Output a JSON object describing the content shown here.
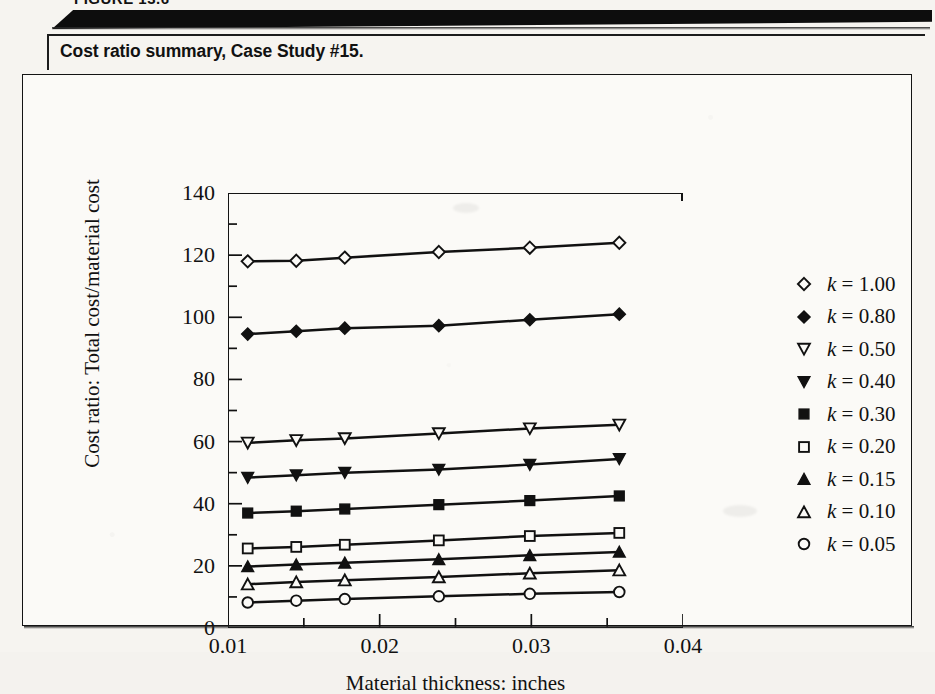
{
  "figure": {
    "number_label": "FIGURE 13.6",
    "caption": "Cost ratio summary, Case Study #15."
  },
  "chart_data": {
    "type": "line",
    "title": "",
    "xlabel": "Material thickness:  inches",
    "ylabel": "Cost ratio:  Total cost/material cost",
    "xlim": [
      0.01,
      0.04
    ],
    "ylim": [
      0,
      140
    ],
    "xticks": [
      0.01,
      0.015,
      0.02,
      0.025,
      0.03,
      0.035,
      0.04
    ],
    "xtick_labels": [
      "0.01",
      "",
      "0.02",
      "",
      "0.03",
      "",
      "0.04"
    ],
    "yticks": [
      0,
      10,
      20,
      30,
      40,
      50,
      60,
      70,
      80,
      90,
      100,
      110,
      120,
      130,
      140
    ],
    "ytick_labels": [
      "0",
      "",
      "20",
      "",
      "40",
      "",
      "60",
      "",
      "80",
      "",
      "100",
      "",
      "120",
      "",
      "140"
    ],
    "grid": false,
    "legend_position": "right",
    "x": [
      0.0113,
      0.0145,
      0.0177,
      0.0239,
      0.0299,
      0.0358
    ],
    "series": [
      {
        "name": "k = 1.00",
        "marker": "diamond-open",
        "values": [
          118.0,
          118.2,
          119.2,
          121.0,
          122.4,
          124.0
        ]
      },
      {
        "name": "k = 0.80",
        "marker": "diamond-filled",
        "values": [
          94.6,
          95.5,
          96.5,
          97.3,
          99.2,
          101.0
        ]
      },
      {
        "name": "k = 0.50",
        "marker": "triangle-down-open",
        "values": [
          59.6,
          60.4,
          61.0,
          62.6,
          64.2,
          65.4
        ]
      },
      {
        "name": "k = 0.40",
        "marker": "triangle-down-filled",
        "values": [
          48.4,
          49.2,
          50.0,
          51.0,
          52.6,
          54.4
        ]
      },
      {
        "name": "k = 0.30",
        "marker": "square-filled",
        "values": [
          37.0,
          37.6,
          38.3,
          39.7,
          41.0,
          42.5
        ]
      },
      {
        "name": "k = 0.20",
        "marker": "square-open",
        "values": [
          25.6,
          26.1,
          26.8,
          28.2,
          29.6,
          30.6
        ]
      },
      {
        "name": "k = 0.15",
        "marker": "triangle-up-filled",
        "values": [
          19.8,
          20.4,
          21.0,
          22.1,
          23.4,
          24.5
        ]
      },
      {
        "name": "k = 0.10",
        "marker": "triangle-up-open",
        "values": [
          14.1,
          14.8,
          15.4,
          16.4,
          17.6,
          18.6
        ]
      },
      {
        "name": "k = 0.05",
        "marker": "circle-open",
        "values": [
          8.2,
          8.8,
          9.3,
          10.2,
          11.0,
          11.6
        ]
      }
    ],
    "legend": [
      {
        "label": "k = 1.00",
        "marker": "diamond-open"
      },
      {
        "label": "k = 0.80",
        "marker": "diamond-filled"
      },
      {
        "label": "k = 0.50",
        "marker": "triangle-down-open"
      },
      {
        "label": "k = 0.40",
        "marker": "triangle-down-filled"
      },
      {
        "label": "k = 0.30",
        "marker": "square-filled"
      },
      {
        "label": "k = 0.20",
        "marker": "square-open"
      },
      {
        "label": "k = 0.15",
        "marker": "triangle-up-filled"
      },
      {
        "label": "k = 0.10",
        "marker": "triangle-up-open"
      },
      {
        "label": "k = 0.05",
        "marker": "circle-open"
      }
    ],
    "colors": {
      "ink": "#111111",
      "paper": "#fbfaf7"
    }
  }
}
